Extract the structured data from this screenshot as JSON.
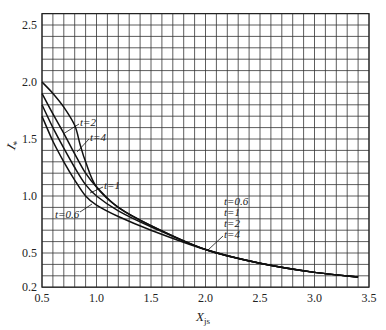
{
  "chart_data": {
    "type": "line",
    "title": "",
    "xlabel": "X",
    "xlabel_sub": "js",
    "ylabel": "I",
    "ylabel_sub": "*",
    "xlim": [
      0.5,
      3.5
    ],
    "ylim": [
      0.2,
      2.6
    ],
    "grid": true,
    "grid_step_x": 0.1,
    "grid_step_y": 0.1,
    "x_ticks": [
      0.5,
      1.0,
      1.5,
      2.0,
      2.5,
      3.0,
      3.5
    ],
    "x_tick_labels": [
      "0.5",
      "1.0",
      "1.5",
      "2.0",
      "2.5",
      "3.0",
      "3.5"
    ],
    "y_ticks": [
      0.2,
      0.5,
      1.0,
      1.5,
      2.0,
      2.5
    ],
    "y_tick_labels": [
      "0.2",
      "0.5",
      "1.0",
      "1.5",
      "2.0",
      "2.5"
    ],
    "series": [
      {
        "name": "t=4",
        "x": [
          0.5,
          0.6,
          0.7,
          0.8,
          0.85,
          0.9,
          1.0,
          1.2,
          1.5,
          2.0,
          2.5,
          3.0,
          3.4
        ],
        "values": [
          2.0,
          1.9,
          1.78,
          1.62,
          1.45,
          1.3,
          1.08,
          0.9,
          0.74,
          0.53,
          0.41,
          0.33,
          0.29
        ]
      },
      {
        "name": "t=2",
        "x": [
          0.5,
          0.6,
          0.7,
          0.8,
          0.9,
          1.0,
          1.2,
          1.5,
          2.0,
          2.5,
          3.0,
          3.4
        ],
        "values": [
          1.9,
          1.72,
          1.55,
          1.37,
          1.2,
          1.08,
          0.9,
          0.74,
          0.53,
          0.41,
          0.33,
          0.29
        ]
      },
      {
        "name": "t=1",
        "x": [
          0.5,
          0.6,
          0.7,
          0.8,
          0.9,
          1.0,
          1.2,
          1.5,
          2.0,
          2.5,
          3.0,
          3.4
        ],
        "values": [
          1.8,
          1.6,
          1.42,
          1.25,
          1.1,
          1.0,
          0.87,
          0.73,
          0.53,
          0.41,
          0.33,
          0.29
        ]
      },
      {
        "name": "t=0.6",
        "x": [
          0.5,
          0.6,
          0.7,
          0.8,
          0.9,
          1.0,
          1.2,
          1.5,
          2.0,
          2.5,
          3.0,
          3.4
        ],
        "values": [
          1.7,
          1.48,
          1.3,
          1.14,
          1.0,
          0.92,
          0.82,
          0.7,
          0.53,
          0.41,
          0.33,
          0.29
        ]
      }
    ],
    "annotations": [
      {
        "text": "t=2",
        "x": 0.88,
        "y": 1.66,
        "points_to": "t=2 curve"
      },
      {
        "text": "t=4",
        "x": 0.98,
        "y": 1.54,
        "points_to": "t=4 curve"
      },
      {
        "text": "t=1",
        "x": 1.1,
        "y": 1.1,
        "points_to": "t=1 curve"
      },
      {
        "text": "t=0.6",
        "x": 0.62,
        "y": 0.92,
        "points_to": "t=0.6 curve"
      },
      {
        "text": "t=0.6",
        "x": 2.05,
        "y": 0.8
      },
      {
        "text": "t=1",
        "x": 2.05,
        "y": 0.72
      },
      {
        "text": "t=2",
        "x": 2.05,
        "y": 0.64
      },
      {
        "text": "t=4",
        "x": 2.05,
        "y": 0.57,
        "points_to": "merged curves near X=2.0"
      }
    ]
  }
}
